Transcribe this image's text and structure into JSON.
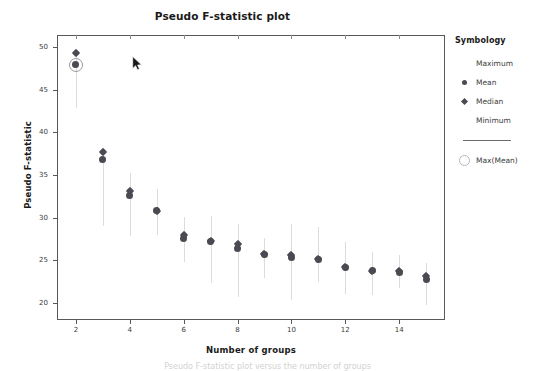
{
  "chart_data": {
    "type": "scatter",
    "title": "Pseudo F-statistic plot",
    "xlabel": "Number of groups",
    "ylabel": "Pseudo F-statistic",
    "xlim": [
      1.3,
      15.7
    ],
    "ylim": [
      18.0,
      51.4
    ],
    "xticks": [
      2,
      4,
      6,
      8,
      10,
      12,
      14
    ],
    "yticks": [
      20,
      25,
      30,
      35,
      40,
      45,
      50
    ],
    "grid": false,
    "legend_position": "right",
    "x": [
      2,
      3,
      4,
      5,
      6,
      7,
      8,
      9,
      10,
      11,
      12,
      13,
      14,
      15
    ],
    "series": [
      {
        "name": "Mean",
        "values": [
          47.9,
          36.8,
          32.6,
          30.8,
          27.5,
          27.2,
          26.4,
          25.7,
          25.3,
          25.1,
          24.1,
          23.8,
          23.6,
          22.7
        ]
      },
      {
        "name": "Median",
        "values": [
          49.3,
          37.7,
          33.1,
          30.8,
          28.0,
          27.2,
          26.9,
          25.7,
          25.6,
          25.1,
          24.2,
          23.8,
          23.7,
          23.1
        ]
      },
      {
        "name": "Maximum",
        "values": [
          49.8,
          38.1,
          35.2,
          33.3,
          30.1,
          30.2,
          29.2,
          27.6,
          29.2,
          28.9,
          27.1,
          26.0,
          25.6,
          24.7
        ]
      },
      {
        "name": "Minimum",
        "values": [
          42.8,
          29.0,
          27.9,
          28.0,
          24.8,
          22.3,
          20.7,
          22.9,
          20.3,
          22.4,
          21.1,
          20.9,
          21.8,
          19.7
        ]
      }
    ],
    "highlight": {
      "label": "Max(Mean)",
      "x": 2,
      "y": 47.9
    }
  },
  "legend": {
    "title": "Symbology",
    "items": [
      {
        "label": "Maximum",
        "marker": "line-blank"
      },
      {
        "label": "Mean",
        "marker": "circle"
      },
      {
        "label": "Median",
        "marker": "diamond"
      },
      {
        "label": "Minimum",
        "marker": "line-blank"
      },
      {
        "label": "Max(Mean)",
        "marker": "ring"
      }
    ]
  },
  "colors": {
    "mean": "#4a4a52",
    "median": "#4a4a52",
    "whisker": "#dcdcdc",
    "highlight_ring": "#9a9aa0",
    "frame": "#58595b",
    "text": "#1a1a1a"
  },
  "cursor": {
    "name": "mouse-pointer",
    "x": 132,
    "y": 56
  },
  "caption": {
    "text": "Pseudo F-statistic plot versus the number of groups"
  }
}
